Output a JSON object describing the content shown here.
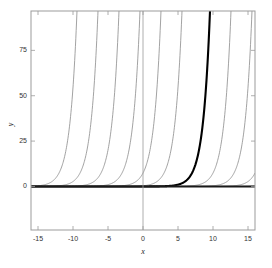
{
  "chart_data": {
    "type": "line",
    "title": "",
    "xlabel": "x",
    "ylabel": "y",
    "xlim": [
      -16.0,
      16.0
    ],
    "ylim": [
      -24.0,
      96.7
    ],
    "grid": false,
    "legend": false,
    "xticks": [
      -15,
      -10,
      -5,
      0,
      5,
      10,
      15
    ],
    "xtick_labels": [
      "-15",
      "-10",
      "-5",
      "0",
      "5",
      "10",
      "15"
    ],
    "yticks": [
      0,
      25,
      50,
      75
    ],
    "ytick_labels": [
      "0",
      "25",
      "50",
      "75"
    ],
    "series": [
      {
        "name": "c = -14",
        "shift": -14,
        "emphasis": "thin",
        "color": "#8a8a8a"
      },
      {
        "name": "c = -11",
        "shift": -11,
        "emphasis": "thin",
        "color": "#8a8a8a"
      },
      {
        "name": "c = -8",
        "shift": -8,
        "emphasis": "thin",
        "color": "#8a8a8a"
      },
      {
        "name": "c = -5",
        "shift": -5,
        "emphasis": "thin",
        "color": "#8a8a8a"
      },
      {
        "name": "c = -2",
        "shift": -2,
        "emphasis": "thin",
        "color": "#8a8a8a"
      },
      {
        "name": "c = 1",
        "shift": 1,
        "emphasis": "thin",
        "color": "#8a8a8a"
      },
      {
        "name": "c = 5",
        "shift": 5,
        "emphasis": "bold",
        "color": "#000000"
      },
      {
        "name": "c = 8",
        "shift": 8,
        "emphasis": "thin",
        "color": "#8a8a8a"
      },
      {
        "name": "c = 11",
        "shift": 11,
        "emphasis": "thin",
        "color": "#8a8a8a"
      },
      {
        "name": "c = 14",
        "shift": 14,
        "emphasis": "thin",
        "color": "#8a8a8a"
      },
      {
        "name": "c = 17",
        "shift": 17,
        "emphasis": "thin",
        "color": "#8a8a8a"
      }
    ],
    "reference_lines": [
      {
        "name": "y-zero-asymptote",
        "orientation": "horizontal",
        "value": 0,
        "color": "#1a1a1a",
        "width": 2.0
      },
      {
        "name": "x-zero-axis",
        "orientation": "vertical",
        "value": 0,
        "color": "#999999",
        "width": 0.8
      }
    ],
    "colors": {
      "curve_thin": "#8a8a8a",
      "curve_bold": "#000000",
      "axis_box": "#9b9b9b",
      "zero_line": "#1a1a1a",
      "text": "#333333",
      "background": "#ffffff"
    }
  },
  "plot_box": {
    "left": 31,
    "top": 11,
    "right": 255,
    "bottom": 230
  }
}
